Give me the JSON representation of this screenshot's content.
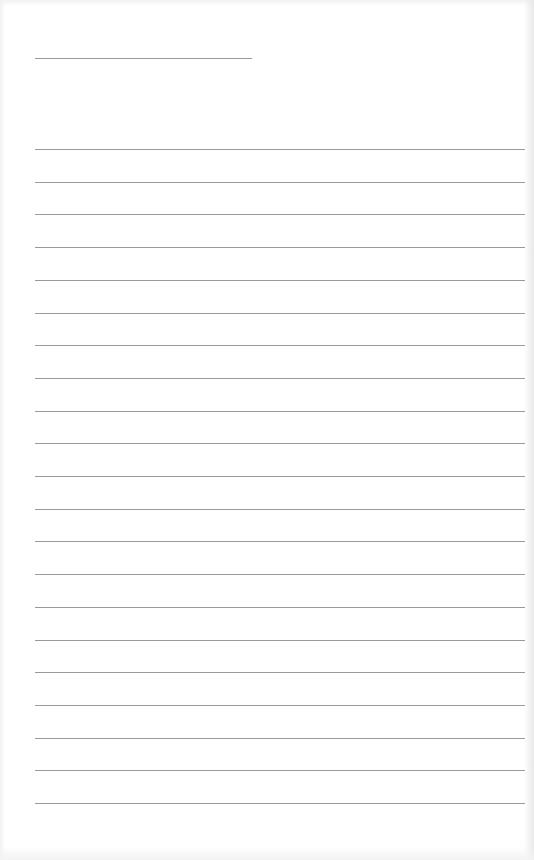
{
  "page": {
    "type": "ruled-paper",
    "background_color": "#ffffff",
    "rule_color": "#9a9a9a"
  },
  "header_line": {
    "x": 35,
    "y": 58,
    "width": 217
  },
  "ruled_lines": {
    "count": 21,
    "start_y": 149,
    "spacing": 32.7,
    "x": 35,
    "width": 490
  }
}
